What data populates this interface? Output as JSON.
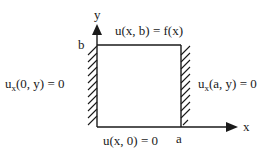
{
  "diagram": {
    "axes": {
      "x_label": "x",
      "y_label": "y",
      "x_tick_label": "a",
      "y_tick_label": "b"
    },
    "boundary_conditions": {
      "top": "u(x, b) = f(x)",
      "bottom": "u(x, 0) = 0",
      "left": {
        "base": "u",
        "subscript": "x",
        "rest": "(0, y) = 0"
      },
      "right": {
        "base": "u",
        "subscript": "x",
        "rest": "(a, y) = 0"
      }
    },
    "insulated_edges": [
      "left",
      "right"
    ],
    "colors": {
      "stroke": "#1a1a1a",
      "background": "#ffffff"
    }
  }
}
